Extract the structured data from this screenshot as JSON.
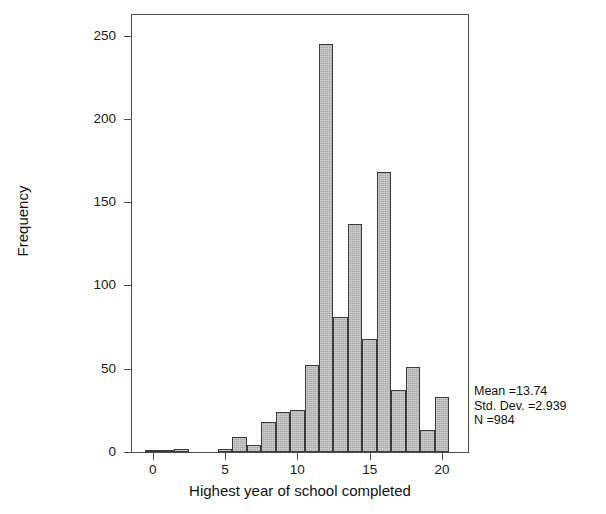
{
  "chart_data": {
    "type": "bar",
    "title": "",
    "subtitle": "",
    "xlabel": "Highest year of school completed",
    "ylabel": "Frequency",
    "xlim": [
      -1.5,
      21.8
    ],
    "ylim": [
      0,
      263
    ],
    "grid": false,
    "legend": "none",
    "bin_width": 1,
    "xticks": [
      0,
      5,
      10,
      15,
      20
    ],
    "xtick_labels": [
      "0",
      "5",
      "10",
      "15",
      "20"
    ],
    "yticks": [
      0,
      50,
      100,
      150,
      200,
      250
    ],
    "ytick_labels": [
      "0",
      "50",
      "100",
      "150",
      "200",
      "250"
    ],
    "categories": [
      0,
      1,
      2,
      3,
      4,
      5,
      6,
      7,
      8,
      9,
      10,
      11,
      12,
      13,
      14,
      15,
      16,
      17,
      18,
      19,
      20
    ],
    "values": [
      1,
      1,
      2,
      0,
      0,
      2,
      9,
      4,
      18,
      24,
      25,
      52,
      245,
      81,
      137,
      68,
      168,
      37,
      51,
      13,
      33
    ],
    "bar_color": "#a9a9a9",
    "bar_edge_color": "#3b3b3b",
    "axis_color": "#4d4d4d"
  },
  "annotations": {
    "mean_label": "Mean =13.74",
    "std_dev_label": "Std. Dev. =2.939",
    "n_label": "N =984"
  }
}
